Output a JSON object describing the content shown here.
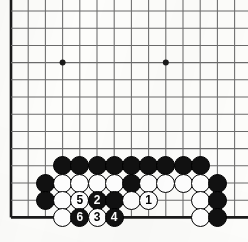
{
  "board": {
    "kind": "go-board-diagram",
    "description": "Go (baduk) life-and-death / endgame problem diagram showing the lower-left corner of a board with a numbered move sequence 1-6",
    "geometry": {
      "origin_x": 11,
      "origin_y": 11,
      "spacing": 17.2,
      "columns": 14,
      "rows": 13,
      "left_edge_col": 0,
      "bottom_edge_row": 12,
      "stone_radius": 9.5,
      "line_color": "#6b6b6b",
      "edge_color": "#1a1a1a",
      "background_color": "#fdfdfb",
      "black_color": "#111111",
      "white_color": "#ffffff"
    },
    "star_points": [
      {
        "col": 3,
        "row": 3
      },
      {
        "col": 9,
        "row": 3
      }
    ],
    "stones": [
      {
        "col": 3,
        "row": 9,
        "color": "black",
        "label": ""
      },
      {
        "col": 4,
        "row": 9,
        "color": "black",
        "label": ""
      },
      {
        "col": 5,
        "row": 9,
        "color": "black",
        "label": ""
      },
      {
        "col": 6,
        "row": 9,
        "color": "black",
        "label": ""
      },
      {
        "col": 7,
        "row": 9,
        "color": "black",
        "label": ""
      },
      {
        "col": 8,
        "row": 9,
        "color": "black",
        "label": ""
      },
      {
        "col": 9,
        "row": 9,
        "color": "black",
        "label": ""
      },
      {
        "col": 10,
        "row": 9,
        "color": "black",
        "label": ""
      },
      {
        "col": 11,
        "row": 9,
        "color": "black",
        "label": ""
      },
      {
        "col": 2,
        "row": 10,
        "color": "black",
        "label": ""
      },
      {
        "col": 3,
        "row": 10,
        "color": "white",
        "label": ""
      },
      {
        "col": 4,
        "row": 10,
        "color": "white",
        "label": ""
      },
      {
        "col": 5,
        "row": 10,
        "color": "white",
        "label": ""
      },
      {
        "col": 6,
        "row": 10,
        "color": "white",
        "label": ""
      },
      {
        "col": 7,
        "row": 10,
        "color": "black",
        "label": ""
      },
      {
        "col": 8,
        "row": 10,
        "color": "white",
        "label": ""
      },
      {
        "col": 9,
        "row": 10,
        "color": "white",
        "label": ""
      },
      {
        "col": 10,
        "row": 10,
        "color": "white",
        "label": ""
      },
      {
        "col": 11,
        "row": 10,
        "color": "white",
        "label": ""
      },
      {
        "col": 12,
        "row": 10,
        "color": "black",
        "label": ""
      },
      {
        "col": 2,
        "row": 11,
        "color": "black",
        "label": ""
      },
      {
        "col": 3,
        "row": 11,
        "color": "white",
        "label": ""
      },
      {
        "col": 4,
        "row": 11,
        "color": "white",
        "label": "5"
      },
      {
        "col": 5,
        "row": 11,
        "color": "black",
        "label": "2"
      },
      {
        "col": 6,
        "row": 11,
        "color": "black",
        "label": ""
      },
      {
        "col": 7,
        "row": 11,
        "color": "white",
        "label": ""
      },
      {
        "col": 8,
        "row": 11,
        "color": "white",
        "label": "1"
      },
      {
        "col": 11,
        "row": 11,
        "color": "white",
        "label": ""
      },
      {
        "col": 12,
        "row": 11,
        "color": "black",
        "label": ""
      },
      {
        "col": 3,
        "row": 12,
        "color": "white",
        "label": ""
      },
      {
        "col": 4,
        "row": 12,
        "color": "black",
        "label": "6"
      },
      {
        "col": 5,
        "row": 12,
        "color": "white",
        "label": "3"
      },
      {
        "col": 6,
        "row": 12,
        "color": "black",
        "label": "4"
      },
      {
        "col": 11,
        "row": 12,
        "color": "white",
        "label": ""
      },
      {
        "col": 12,
        "row": 12,
        "color": "black",
        "label": ""
      }
    ],
    "move_sequence": [
      {
        "number": "1",
        "color": "white",
        "col": 8,
        "row": 11
      },
      {
        "number": "2",
        "color": "black",
        "col": 5,
        "row": 11
      },
      {
        "number": "3",
        "color": "white",
        "col": 5,
        "row": 12
      },
      {
        "number": "4",
        "color": "black",
        "col": 6,
        "row": 12
      },
      {
        "number": "5",
        "color": "white",
        "col": 4,
        "row": 11
      },
      {
        "number": "6",
        "color": "black",
        "col": 4,
        "row": 12
      }
    ]
  }
}
